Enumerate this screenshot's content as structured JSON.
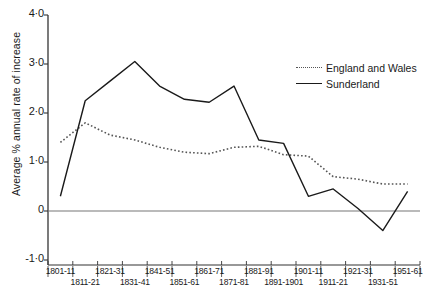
{
  "chart_data": {
    "type": "line",
    "title": "",
    "xlabel": "",
    "ylabel": "Average % annual rate of increase",
    "ylim": [
      -1.0,
      4.0
    ],
    "ytick_values": [
      4.0,
      3.0,
      2.0,
      1.0,
      0,
      -1.0
    ],
    "ytick_labels": [
      "4·0",
      "3·0",
      "2·0",
      "1·0",
      "0",
      "-1·0"
    ],
    "grid": false,
    "zero_line": true,
    "legend_position": "top-right",
    "categories": [
      "1801-11",
      "1811-21",
      "1821-31",
      "1831-41",
      "1841-51",
      "1851-61",
      "1861-71",
      "1871-81",
      "1881-91",
      "1891-1901",
      "1901-11",
      "1911-21",
      "1921-31",
      "1931-51",
      "1951-61"
    ],
    "xtick_labels_top": [
      "1801-11",
      "1821-31",
      "1841-51",
      "1861-71",
      "1881-91",
      "1901-11",
      "1921-31",
      "1951-61"
    ],
    "xtick_labels_bottom": [
      "1811-21",
      "1831-41",
      "1851-61",
      "1871-81",
      "1891-1901",
      "1911-21",
      "1931-51"
    ],
    "series": [
      {
        "name": "England and Wales",
        "style": "dotted",
        "color": "#555555",
        "values": [
          1.4,
          1.8,
          1.55,
          1.45,
          1.3,
          1.2,
          1.17,
          1.3,
          1.32,
          1.15,
          1.12,
          0.7,
          0.65,
          0.55,
          0.55
        ]
      },
      {
        "name": "Sunderland",
        "style": "solid",
        "color": "#1a1a1a",
        "values": [
          0.3,
          2.25,
          2.65,
          3.05,
          2.55,
          2.28,
          2.22,
          2.55,
          1.45,
          1.38,
          0.3,
          0.45,
          0.05,
          -0.4,
          0.4
        ]
      }
    ]
  },
  "legend": {
    "items": [
      {
        "label": "England and Wales",
        "style": "dotted"
      },
      {
        "label": "Sunderland",
        "style": "solid"
      }
    ]
  },
  "caption": ""
}
